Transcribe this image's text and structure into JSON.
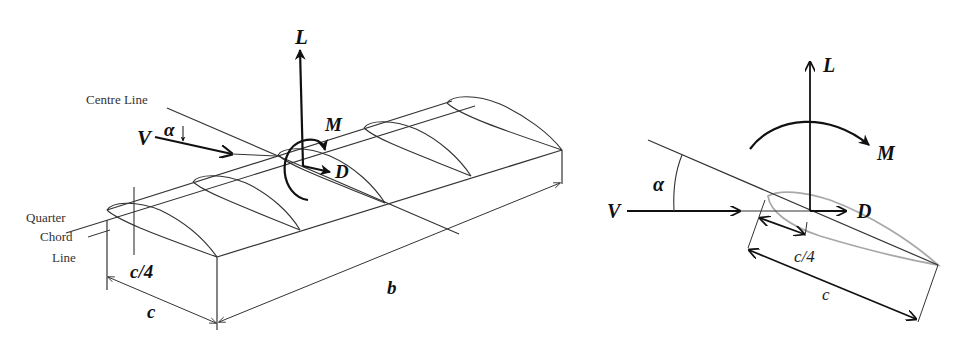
{
  "figure": {
    "left_panel": {
      "name": "3D wing section",
      "labels": {
        "lift": "L",
        "moment": "M",
        "drag": "D",
        "velocity": "V",
        "alpha": "α",
        "centre_line": "Centre Line",
        "quarter_chord_line_1": "Quarter",
        "quarter_chord_line_2": "Chord",
        "quarter_chord_line_3": "Line",
        "quarter_chord": "c/4",
        "chord": "c",
        "span": "b"
      }
    },
    "right_panel": {
      "name": "2D airfoil section",
      "labels": {
        "lift": "L",
        "moment": "M",
        "drag": "D",
        "velocity": "V",
        "alpha": "α",
        "quarter_chord": "c/4",
        "chord": "c"
      }
    },
    "colors": {
      "ink": "#111111",
      "thin_line": "#333333",
      "airfoil_gray": "#a8a8a8",
      "background": "#ffffff"
    }
  }
}
